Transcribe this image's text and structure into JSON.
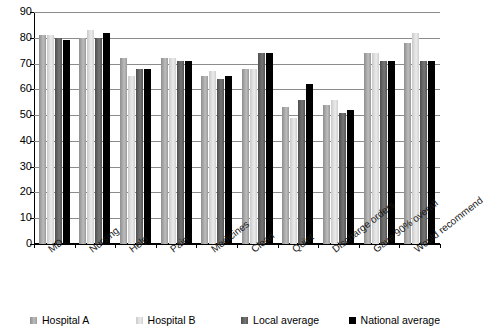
{
  "chart_data": {
    "type": "bar",
    "title": "",
    "xlabel": "",
    "ylabel": "",
    "ylim": [
      0,
      90
    ],
    "ytick_step": 10,
    "yticks": [
      90,
      80,
      70,
      60,
      50,
      40,
      30,
      20,
      10,
      0
    ],
    "grid": true,
    "legend_position": "bottom",
    "categories": [
      "MD",
      "Nursing",
      "Help",
      "Pain",
      "Medicines",
      "Clean",
      "Quiet",
      "Discharge orders",
      "Gave 90% overall",
      "Would recommend"
    ],
    "series": [
      {
        "name": "Hospital A",
        "color": "#a8a8a8",
        "values": [
          81,
          80,
          72,
          72,
          65,
          68,
          53,
          54,
          74,
          78
        ]
      },
      {
        "name": "Hospital B",
        "color": "#dedede",
        "values": [
          81,
          83,
          65,
          72,
          67,
          68,
          49,
          56,
          74,
          82
        ]
      },
      {
        "name": "Local average",
        "color": "#5e5e5e",
        "values": [
          80,
          80,
          68,
          71,
          64,
          74,
          56,
          51,
          71,
          71
        ]
      },
      {
        "name": "National average",
        "color": "#000000",
        "values": [
          79,
          82,
          68,
          71,
          65,
          74,
          62,
          52,
          71,
          71
        ]
      }
    ]
  },
  "legend": {
    "items": [
      {
        "label": "Hospital A"
      },
      {
        "label": "Hospital B"
      },
      {
        "label": "Local average"
      },
      {
        "label": "National average"
      }
    ]
  }
}
